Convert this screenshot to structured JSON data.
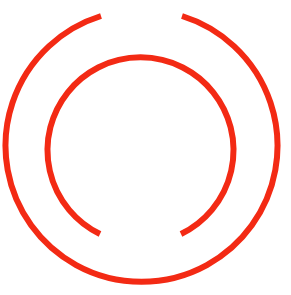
{
  "graphic": {
    "description": "Two concentric red arcs: outer arc open at top, inner arc open at bottom",
    "color": "#f32a14",
    "background": "#ffffff",
    "center": {
      "x": 141,
      "y": 150
    },
    "outer_arc": {
      "radius": 136,
      "stroke_width": 6,
      "gap": "top",
      "gap_start": [
        101,
        16
      ],
      "gap_end": [
        182,
        16
      ]
    },
    "inner_arc": {
      "radius": 93,
      "stroke_width": 6,
      "gap": "bottom",
      "gap_start": [
        100,
        234
      ],
      "gap_end": [
        181,
        234
      ]
    }
  }
}
